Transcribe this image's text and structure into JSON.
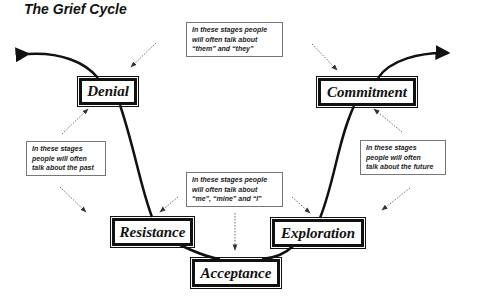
{
  "title": "The Grief Cycle",
  "stages": {
    "denial": "Denial",
    "commitment": "Commitment",
    "resistance": "Resistance",
    "exploration": "Exploration",
    "acceptance": "Acceptance"
  },
  "notes": {
    "top": [
      "In these stages people",
      "will often talk about",
      "“them” and “they”"
    ],
    "left": [
      "In these stages",
      "people will often",
      "talk about the past"
    ],
    "middle": [
      "In these stages people",
      "will often talk about",
      "“me”, “mine” and “I”"
    ],
    "right": [
      "In these stages",
      "people will often",
      "talk about the future"
    ]
  }
}
